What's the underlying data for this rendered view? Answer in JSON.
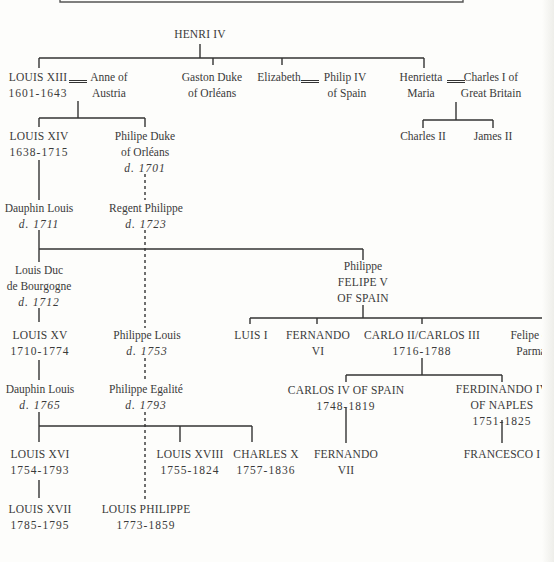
{
  "tree": {
    "root": {
      "name": "HENRI IV"
    },
    "gen1": {
      "louis13": {
        "name": "LOUIS XIII",
        "dates": "1601-1643"
      },
      "anne": {
        "line1": "Anne of",
        "line2": "Austria"
      },
      "gaston": {
        "line1": "Gaston Duke",
        "line2": "of Orléans"
      },
      "elizabeth": {
        "name": "Elizabeth"
      },
      "philip4": {
        "line1": "Philip IV",
        "line2": "of Spain"
      },
      "henrietta": {
        "line1": "Henrietta",
        "line2": "Maria"
      },
      "charles1": {
        "line1": "Charles I of",
        "line2": "Great Britain"
      }
    },
    "gen2": {
      "charles2": {
        "name": "Charles II"
      },
      "james2": {
        "name": "James II"
      },
      "louis14": {
        "name": "LOUIS XIV",
        "dates": "1638-1715"
      },
      "philippe_orleans": {
        "line1": "Philipe Duke",
        "line2": "of Orléans",
        "death": "d. 1701"
      }
    },
    "gen3": {
      "dauphin_louis": {
        "name": "Dauphin Louis",
        "death": "d. 1711"
      },
      "regent_philippe": {
        "name": "Regent Philippe",
        "death": "d. 1723"
      }
    },
    "gen4": {
      "louis_bourgogne": {
        "line1": "Louis Duc",
        "line2": "de Bourgogne",
        "death": "d. 1712"
      },
      "felipe5": {
        "line1": "Philippe",
        "line2": "FELIPE V",
        "line3": "OF SPAIN"
      }
    },
    "gen5": {
      "louis15": {
        "name": "LOUIS XV",
        "dates": "1710-1774"
      },
      "philippe_louis": {
        "name": "Philippe Louis",
        "death": "d. 1753"
      },
      "luis1": {
        "name": "LUIS I"
      },
      "fernando6": {
        "line1": "FERNANDO",
        "line2": "VI"
      },
      "carlo3": {
        "name": "CARLO II/CARLOS III",
        "dates": "1716-1788"
      },
      "felipe_parma": {
        "line1": "Felipe of",
        "line2": "Parma"
      }
    },
    "gen6": {
      "dauphin_louis2": {
        "name": "Dauphin Louis",
        "death": "d. 1765"
      },
      "philippe_egalite": {
        "name": "Philippe Egalité",
        "death": "d. 1793"
      },
      "carlos4": {
        "name": "CARLOS IV OF SPAIN",
        "dates": "1748-1819"
      },
      "ferdinando4": {
        "line1": "FERDINANDO IV",
        "line2": "OF NAPLES",
        "dates": "1751-1825"
      }
    },
    "gen7": {
      "louis16": {
        "name": "LOUIS XVI",
        "dates": "1754-1793"
      },
      "louis18": {
        "name": "LOUIS XVIII",
        "dates": "1755-1824"
      },
      "charles10": {
        "name": "CHARLES X",
        "dates": "1757-1836"
      },
      "fernando7": {
        "line1": "FERNANDO",
        "line2": "VII"
      },
      "francesco1": {
        "name": "FRANCESCO I"
      }
    },
    "gen8": {
      "louis17": {
        "name": "LOUIS XVII",
        "dates": "1785-1795"
      },
      "louis_philippe": {
        "name": "LOUIS PHILIPPE",
        "dates": "1773-1859"
      }
    }
  },
  "colors": {
    "line": "#333333",
    "text": "#3a3a3a",
    "background": "#fdfdfb"
  }
}
